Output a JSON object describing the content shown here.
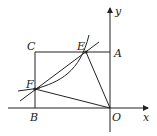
{
  "diagram": {
    "type": "geometry-coordinate-figure",
    "labels": {
      "C": "C",
      "E": "E",
      "A": "A",
      "F": "F",
      "B": "B",
      "O": "O",
      "x": "x",
      "y": "y"
    },
    "points": {
      "O": [
        110,
        108
      ],
      "A": [
        110,
        52
      ],
      "B": [
        35,
        108
      ],
      "C": [
        35,
        52
      ],
      "E": [
        86,
        52
      ],
      "F": [
        35,
        89
      ]
    },
    "stroke_color": "#222222"
  }
}
